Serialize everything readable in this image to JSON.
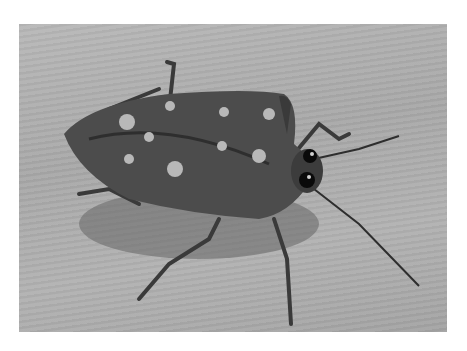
{
  "image": {
    "subject": "spotted shield bug on wooden surface",
    "style": "grayscale photograph",
    "colors": {
      "background": "#ffffff",
      "wood": "#b0b0b0",
      "bug_body": "#4a4a4a",
      "spots": "#b8b8b8",
      "eyes": "#0a0a0a"
    }
  }
}
